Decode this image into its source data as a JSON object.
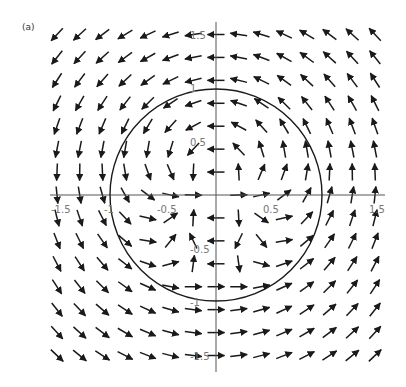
{
  "figure": {
    "panel_label": "(a)"
  },
  "chart_data": {
    "type": "vector_field",
    "title": "",
    "panel": "(a)",
    "xlabel": "",
    "ylabel": "",
    "xlim": [
      -1.5,
      1.5
    ],
    "ylim": [
      -1.5,
      1.5
    ],
    "x_ticks": [
      "-1.5",
      "-1",
      "-0.5",
      "0.5",
      "1.5"
    ],
    "y_ticks": [
      "1.5",
      "1",
      "0.5",
      "-0.5",
      "-1",
      "-1.5"
    ],
    "grid": false,
    "grid_resolution": [
      15,
      15
    ],
    "field_description": "counterclockwise circulation around origin with a dipole-like singularity at the origin (flow exits along +x, enters along -x)",
    "overlays": [
      {
        "type": "circle",
        "center": [
          0,
          0
        ],
        "radius": 1
      }
    ],
    "colors": {
      "arrows": "#1a1a1a",
      "axes": "#555555",
      "circle": "#1a1a1a"
    }
  }
}
